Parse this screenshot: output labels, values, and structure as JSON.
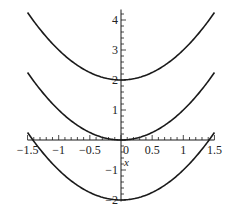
{
  "chart_data": {
    "type": "line",
    "title": "",
    "xlabel": "x",
    "ylabel": "",
    "xlim": [
      -1.5,
      1.5
    ],
    "ylim": [
      -2,
      4.25
    ],
    "grid": false,
    "legend": null,
    "x_ticks": [
      -1.5,
      -1,
      -0.5,
      0,
      0.5,
      1,
      1.5
    ],
    "x_tick_labels": [
      "−1.5",
      "−1",
      "−0.5",
      "0",
      "0.5",
      "1",
      "1.5"
    ],
    "y_ticks": [
      -2,
      -1,
      1,
      2,
      3,
      4
    ],
    "y_tick_labels": [
      "−2",
      "−1",
      "1",
      "2",
      "3",
      "4"
    ],
    "series": [
      {
        "name": "x^2+2",
        "expression": "x^2 + 2",
        "x": [
          -1.5,
          -1,
          -0.5,
          0,
          0.5,
          1,
          1.5
        ],
        "values": [
          4.25,
          3,
          2.25,
          2,
          2.25,
          3,
          4.25
        ]
      },
      {
        "name": "x^2",
        "expression": "x^2",
        "x": [
          -1.5,
          -1,
          -0.5,
          0,
          0.5,
          1,
          1.5
        ],
        "values": [
          2.25,
          1,
          0.25,
          0,
          0.25,
          1,
          2.25
        ]
      },
      {
        "name": "x^2-2",
        "expression": "x^2 - 2",
        "x": [
          -1.5,
          -1,
          -0.5,
          0,
          0.5,
          1,
          1.5
        ],
        "values": [
          0.25,
          -1,
          -1.75,
          -2,
          -1.75,
          -1,
          0.25
        ]
      }
    ],
    "line_color": "#1a1a1a"
  }
}
